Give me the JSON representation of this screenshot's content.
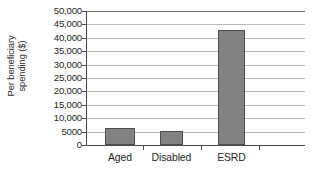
{
  "chart_data": {
    "type": "bar",
    "title": "",
    "subtitle": "",
    "xlabel": "",
    "ylabel": "Per beneficiary spending ($)",
    "ylabel_lines": [
      "Per beneficiary",
      "spending ($)"
    ],
    "categories": [
      "Aged",
      "Disabled",
      "ESRD"
    ],
    "values": [
      6400,
      5100,
      43000
    ],
    "series": [
      {
        "name": "Per beneficiary spending",
        "values": [
          6400,
          5100,
          43000
        ]
      }
    ],
    "ylim": [
      0,
      50000
    ],
    "ytick_values": [
      50000,
      45000,
      40000,
      35000,
      30000,
      25000,
      20000,
      15000,
      10000,
      5000,
      0
    ],
    "ytick_labels": [
      "50,000",
      "45,000",
      "40,000",
      "35,000",
      "30,000",
      "25,000",
      "20,000",
      "15,000",
      "10,000",
      "5000",
      "0"
    ],
    "ytick_interval": 5000,
    "grid": true,
    "grid_axis": "y",
    "legend": false,
    "legend_position": "none",
    "annotations": [],
    "bar_fill_color": "#828282",
    "bar_border_color": "#4d4d4d",
    "gridline_color": "#b9b9b9",
    "axis_color": "#4a4a4a",
    "background_color": "#ffffff",
    "bar_geometry": [
      {
        "category": "Aged",
        "left_pct": 8.7,
        "width_pct": 13.7
      },
      {
        "category": "Disabled",
        "left_pct": 33.8,
        "width_pct": 10.5
      },
      {
        "category": "ESRD",
        "left_pct": 60.3,
        "width_pct": 12.3
      }
    ],
    "category_center_pct": [
      15.5,
      39.0,
      66.4
    ],
    "x_separator_pct": [
      26.0,
      52.5,
      79.0
    ]
  }
}
